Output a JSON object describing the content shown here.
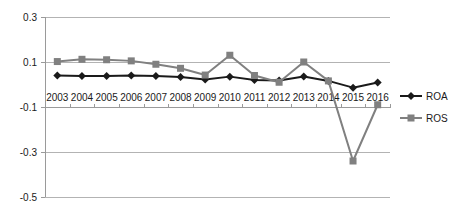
{
  "chart_data": {
    "type": "line",
    "title": "",
    "subtitle": "",
    "xlabel": "",
    "ylabel": "",
    "categories": [
      "2003",
      "2004",
      "2005",
      "2006",
      "2007",
      "2008",
      "2009",
      "2010",
      "2011",
      "2012",
      "2013",
      "2014",
      "2015",
      "2016"
    ],
    "series": [
      {
        "name": "ROA",
        "color": "#1a1a1a",
        "marker": "diamond",
        "values": [
          0.04,
          0.038,
          0.038,
          0.04,
          0.038,
          0.033,
          0.022,
          0.035,
          0.02,
          0.018,
          0.036,
          0.016,
          -0.014,
          0.009
        ]
      },
      {
        "name": "ROS",
        "color": "#808080",
        "marker": "square",
        "values": [
          0.102,
          0.112,
          0.11,
          0.105,
          0.09,
          0.072,
          0.042,
          0.13,
          0.04,
          0.01,
          0.1,
          0.016,
          -0.34,
          -0.09
        ]
      }
    ],
    "ylim": [
      -0.5,
      0.3
    ],
    "yticks": [
      0.3,
      0.1,
      -0.1,
      -0.3,
      -0.5
    ],
    "ytick_labels": [
      "0.3",
      "0.1",
      "-0.1",
      "-0.3",
      "-0.5"
    ],
    "grid": true,
    "grid_axis": "y",
    "legend_position": "right",
    "legend": [
      "ROA",
      "ROS"
    ]
  },
  "legend": {
    "items": [
      {
        "label": "ROA"
      },
      {
        "label": "ROS"
      }
    ]
  }
}
